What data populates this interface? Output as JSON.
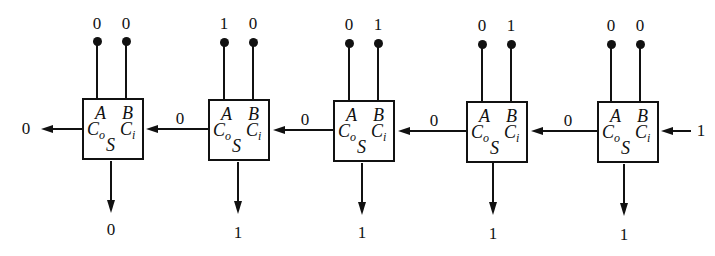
{
  "diagram": {
    "pin_labels": {
      "a": "A",
      "b": "B",
      "co": "C",
      "co_sub": "o",
      "ci": "C",
      "ci_sub": "i",
      "s": "S"
    },
    "adders": [
      {
        "id": "fa1",
        "a": "0",
        "b": "0",
        "carry_out": "0",
        "carry_in": "0",
        "sum": "0"
      },
      {
        "id": "fa2",
        "a": "1",
        "b": "0",
        "carry_out": "0",
        "carry_in": "0",
        "sum": "1"
      },
      {
        "id": "fa3",
        "a": "0",
        "b": "1",
        "carry_out": "0",
        "carry_in": "0",
        "sum": "1"
      },
      {
        "id": "fa4",
        "a": "0",
        "b": "1",
        "carry_out": "0",
        "carry_in": "0",
        "sum": "1"
      },
      {
        "id": "fa5",
        "a": "0",
        "b": "0",
        "carry_out": "0",
        "carry_in": "1",
        "sum": "1"
      }
    ],
    "final_carry_out": "0",
    "initial_carry_in": "1",
    "carry_links": [
      "0",
      "0",
      "0",
      "0"
    ]
  }
}
